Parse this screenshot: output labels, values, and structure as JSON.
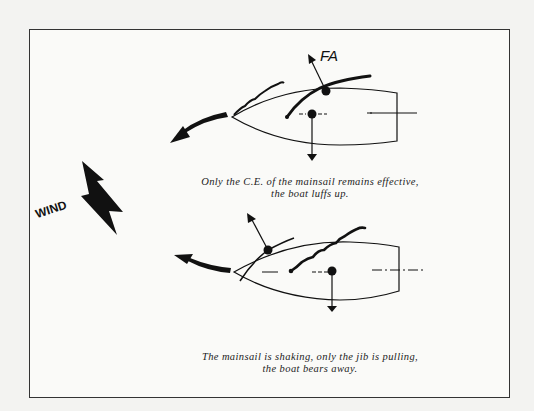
{
  "diagram": {
    "labels": {
      "force_label": "FA",
      "wind_label": "WIND"
    },
    "captions": {
      "top_line1": "Only the C.E. of the mainsail remains effective,",
      "top_line2": "the boat luffs up.",
      "bottom_line1": "The mainsail is shaking, only the jib is pulling,",
      "bottom_line2": "the boat bears away."
    },
    "panels": [
      {
        "id": "top",
        "description": "Jib shaking, mainsail drawing; boat turns toward the wind (luffs up)",
        "active_sail": "mainsail"
      },
      {
        "id": "bottom",
        "description": "Mainsail shaking, jib drawing; boat turns away from the wind (bears away)",
        "active_sail": "jib"
      }
    ],
    "colors": {
      "ink": "#111111",
      "paper": "#fafaf8",
      "frame": "#333333"
    }
  }
}
